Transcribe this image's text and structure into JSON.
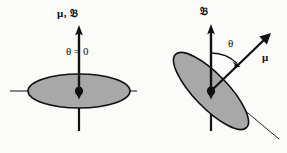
{
  "figure": {
    "background_color": "#fbfbfa",
    "ellipse_fill_color": "#a8a8a8",
    "stroke_color": "#111111"
  },
  "left_panel": {
    "name": "aligned-case",
    "labels": {
      "vector_label": "μ, 𝔅",
      "angle_label": "θ = 0"
    },
    "geometry": {
      "center_x": 79,
      "center_y": 91,
      "ellipse_rx": 51,
      "ellipse_ry": 17,
      "ellipse_rotation_deg": 0,
      "arrow_tip_y": 27,
      "axis_line_x1": 10,
      "axis_line_x2": 137,
      "stub_y1": 106,
      "stub_y2": 131
    }
  },
  "right_panel": {
    "name": "tilted-case",
    "labels": {
      "field_label": "𝔅",
      "angle_label": "θ",
      "moment_label": "μ"
    },
    "geometry": {
      "center_x": 211,
      "center_y": 91,
      "ellipse_rx": 51,
      "ellipse_ry": 17,
      "ellipse_rotation_deg": 46,
      "field_arrow_tip_y": 26,
      "moment_arrow_tip_x": 270,
      "moment_arrow_tip_y": 33,
      "axis_line_x1": 176,
      "axis_line_y1": 53,
      "axis_line_x2": 278,
      "axis_line_y2": 138,
      "stub_y1": 106,
      "stub_y2": 131,
      "angle_arc_radius": 38
    }
  }
}
